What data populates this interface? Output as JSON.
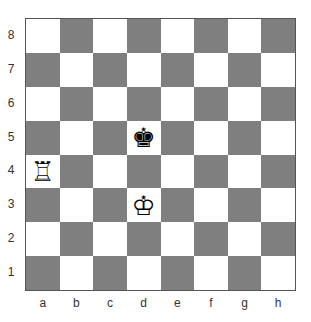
{
  "board": {
    "orientation": "white-bottom",
    "colors": {
      "light": "#ffffff",
      "dark": "#7f7f7f"
    },
    "ranks": [
      "8",
      "7",
      "6",
      "5",
      "4",
      "3",
      "2",
      "1"
    ],
    "files": [
      "a",
      "b",
      "c",
      "d",
      "e",
      "f",
      "g",
      "h"
    ],
    "pieces": [
      {
        "square": "d5",
        "piece": "king",
        "color": "black",
        "glyph": "♚"
      },
      {
        "square": "a4",
        "piece": "rook",
        "color": "white",
        "glyph": "♖"
      },
      {
        "square": "d3",
        "piece": "king",
        "color": "white",
        "glyph": "♔"
      }
    ]
  }
}
